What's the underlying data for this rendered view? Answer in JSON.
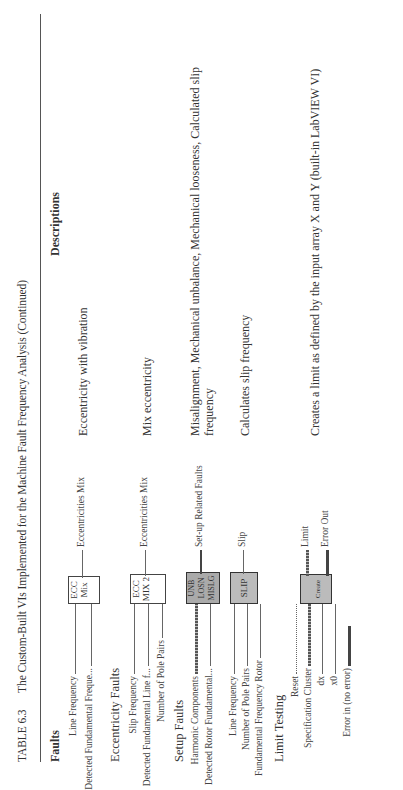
{
  "page_header": "…g",
  "caption": {
    "number": "TABLE 6.3",
    "title": "The Custom-Built VIs Implemented for the Machine Fault Frequency Analysis (Continued)"
  },
  "columns": {
    "faults": "Faults",
    "descriptions": "Descriptions"
  },
  "rows": [
    {
      "section": "",
      "inputs": [
        "Line Frequency",
        "Detected Fundamental Freque..."
      ],
      "vi_icon": [
        "ECC",
        "Mix"
      ],
      "output": "Eccentricities Mix",
      "description": "Eccentricity with vibration"
    },
    {
      "section": "Eccentricity Faults",
      "inputs": [
        "Slip Frequency",
        "Detected Fundamental Line f...",
        "Number of Pole Pairs"
      ],
      "vi_icon": [
        "ECC",
        "MIX 2"
      ],
      "output": "Eccentricities Mix",
      "description": "Mix eccentricity"
    },
    {
      "section": "Setup Faults",
      "inputs": [
        "Harmonic Components",
        "Detected Rotor Fundamental..."
      ],
      "vi_icon": [
        "UNB",
        "LOSN",
        "MISLG"
      ],
      "output": "Set-up Related Faults",
      "description": "Misalignment, Mechanical unbalance, Mechanical looseness, Calculated slip frequency"
    },
    {
      "section": "",
      "inputs": [
        "Line Frequency",
        "Number of Pole Pairs",
        "Fundamental Frequency Rotor"
      ],
      "vi_icon": [
        "SLIP"
      ],
      "output": "Slip",
      "description": "Calculates slip frequency"
    },
    {
      "section": "Limit Testing",
      "inputs": [
        "Reset",
        "Specification Cluster",
        "dx",
        "x0",
        "Error in (no error)"
      ],
      "vi_icon": [
        "Create"
      ],
      "outputs": [
        "Limit",
        "Error Out"
      ],
      "description": "Creates a limit as defined by the input array X and Y (built-in LabVIEW VI)"
    }
  ]
}
